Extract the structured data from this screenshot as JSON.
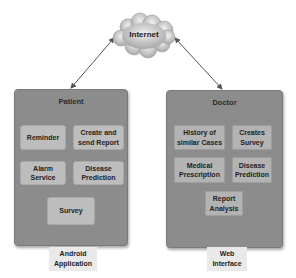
{
  "cloud": {
    "label": "Internet",
    "icon": "cloud-icon"
  },
  "connections": [
    {
      "from": "Internet",
      "to": "Patient",
      "style": "double-arrow"
    },
    {
      "from": "Internet",
      "to": "Doctor",
      "style": "double-arrow"
    }
  ],
  "patient": {
    "title": "Patient",
    "items": [
      "Reminder",
      "Create and send Report",
      "Alarm Service",
      "Disease Prediction",
      "Survey"
    ],
    "footer": "Android Application"
  },
  "doctor": {
    "title": "Doctor",
    "items": [
      "History of similar Cases",
      "Creates Survey",
      "Medical Prescription",
      "Disease Prediction",
      "Report Analysis"
    ],
    "footer": "Web Interface"
  },
  "colors": {
    "panel": "#8c8c8c",
    "patient_item": "#bdbdbd",
    "doctor_item": "#b3b3b3",
    "cloud": "#c8c8c8"
  }
}
